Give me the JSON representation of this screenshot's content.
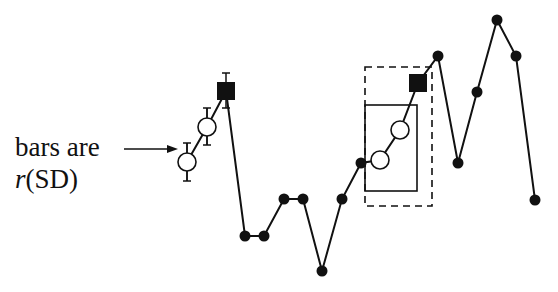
{
  "annotation": {
    "line1": "bars are",
    "line2_italic": "r",
    "line2_rest": "(SD)"
  },
  "colors": {
    "ink": "#111111",
    "background": "#ffffff"
  },
  "series": {
    "connected_points": [
      {
        "x": 187,
        "y": 162,
        "marker": "open-circle",
        "error_bar": [
          143,
          181
        ]
      },
      {
        "x": 207,
        "y": 127,
        "marker": "open-circle",
        "error_bar": [
          108,
          145
        ]
      },
      {
        "x": 226,
        "y": 91,
        "marker": "filled-square",
        "error_bar": [
          73,
          108
        ]
      },
      {
        "x": 245,
        "y": 236,
        "marker": "filled-circle"
      },
      {
        "x": 264,
        "y": 236,
        "marker": "filled-circle"
      },
      {
        "x": 284,
        "y": 199,
        "marker": "filled-circle"
      },
      {
        "x": 303,
        "y": 199,
        "marker": "filled-circle"
      },
      {
        "x": 322,
        "y": 271,
        "marker": "filled-circle"
      },
      {
        "x": 342,
        "y": 199,
        "marker": "filled-circle"
      },
      {
        "x": 361,
        "y": 163,
        "marker": "filled-circle"
      },
      {
        "x": 380,
        "y": 160,
        "marker": "open-circle"
      },
      {
        "x": 400,
        "y": 130,
        "marker": "open-circle"
      },
      {
        "x": 418,
        "y": 83,
        "marker": "filled-square"
      },
      {
        "x": 438,
        "y": 56,
        "marker": "filled-circle"
      },
      {
        "x": 458,
        "y": 163,
        "marker": "filled-circle"
      },
      {
        "x": 477,
        "y": 92,
        "marker": "filled-circle"
      },
      {
        "x": 497,
        "y": 20,
        "marker": "filled-circle"
      },
      {
        "x": 516,
        "y": 56,
        "marker": "filled-circle"
      },
      {
        "x": 535,
        "y": 200,
        "marker": "filled-circle"
      }
    ]
  },
  "boxes": {
    "dashed": {
      "x": 365,
      "y": 67,
      "w": 67,
      "h": 139
    },
    "solid": {
      "x": 365,
      "y": 105,
      "w": 52,
      "h": 86
    }
  },
  "arrow": {
    "x1": 124,
    "y1": 149,
    "x2": 178,
    "y2": 149
  }
}
